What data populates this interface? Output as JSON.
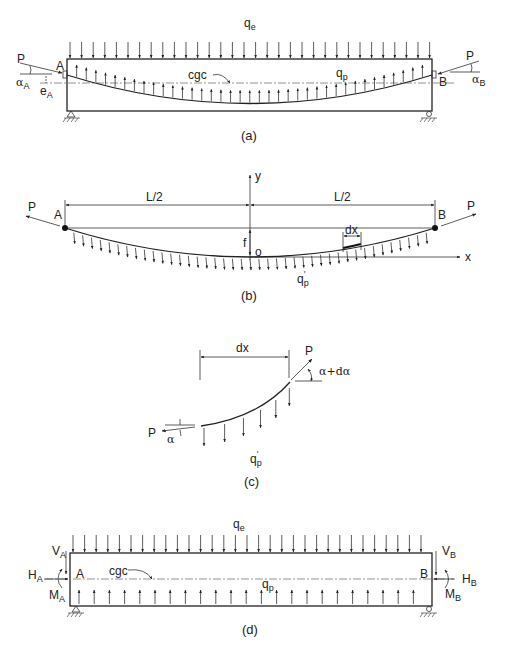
{
  "panel_a": {
    "caption": "(a)",
    "labels": {
      "qe": "q",
      "qe_sub": "e",
      "qp": "q",
      "qp_sub": "p",
      "cgc": "cgc",
      "P_left": "P",
      "P_right": "P",
      "A": "A",
      "B": "B",
      "alpha_A": "α",
      "alpha_A_sub": "A",
      "alpha_B": "α",
      "alpha_B_sub": "B",
      "e_A": "e",
      "e_A_sub": "A"
    }
  },
  "panel_b": {
    "caption": "(b)",
    "labels": {
      "P_left": "P",
      "P_right": "P",
      "A": "A",
      "B": "B",
      "half_span_left": "L/2",
      "half_span_right": "L/2",
      "y_axis": "y",
      "x_axis": "x",
      "origin": "o",
      "sag": "f",
      "dx": "dx",
      "qp_prime": "q",
      "qp_prime_sub": "p",
      "prime": "′"
    }
  },
  "panel_c": {
    "caption": "(c)",
    "labels": {
      "dx": "dx",
      "P_left": "P",
      "P_right": "P",
      "alpha": "α",
      "alpha_plus": "α+dα",
      "qp_prime": "q",
      "qp_prime_sub": "p",
      "prime": "′"
    }
  },
  "panel_d": {
    "caption": "(d)",
    "labels": {
      "qe": "q",
      "qe_sub": "e",
      "qp": "q",
      "qp_sub": "p",
      "cgc": "cgc",
      "A": "A",
      "B": "B",
      "V_A": "V",
      "V_A_sub": "A",
      "H_A": "H",
      "H_A_sub": "A",
      "M_A": "M",
      "M_A_sub": "A",
      "V_B": "V",
      "V_B_sub": "B",
      "H_B": "H",
      "H_B_sub": "B",
      "M_B": "M",
      "M_B_sub": "B"
    }
  }
}
